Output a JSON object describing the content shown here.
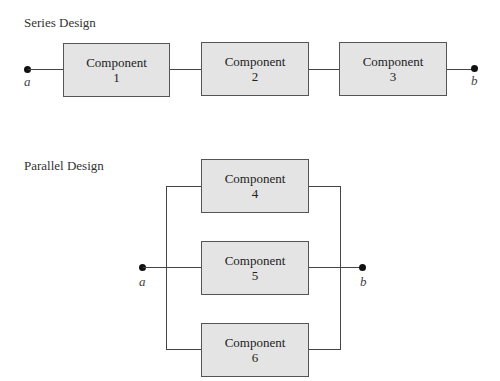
{
  "series": {
    "title": "Series Design",
    "terminal_start": "a",
    "terminal_end": "b",
    "components": [
      {
        "name": "Component",
        "number": "1"
      },
      {
        "name": "Component",
        "number": "2"
      },
      {
        "name": "Component",
        "number": "3"
      }
    ]
  },
  "parallel": {
    "title": "Parallel Design",
    "terminal_start": "a",
    "terminal_end": "b",
    "components": [
      {
        "name": "Component",
        "number": "4"
      },
      {
        "name": "Component",
        "number": "5"
      },
      {
        "name": "Component",
        "number": "6"
      }
    ]
  },
  "colors": {
    "box_fill": "#e4e4e4",
    "box_border": "#555555",
    "line": "#444444",
    "node": "#111111"
  }
}
